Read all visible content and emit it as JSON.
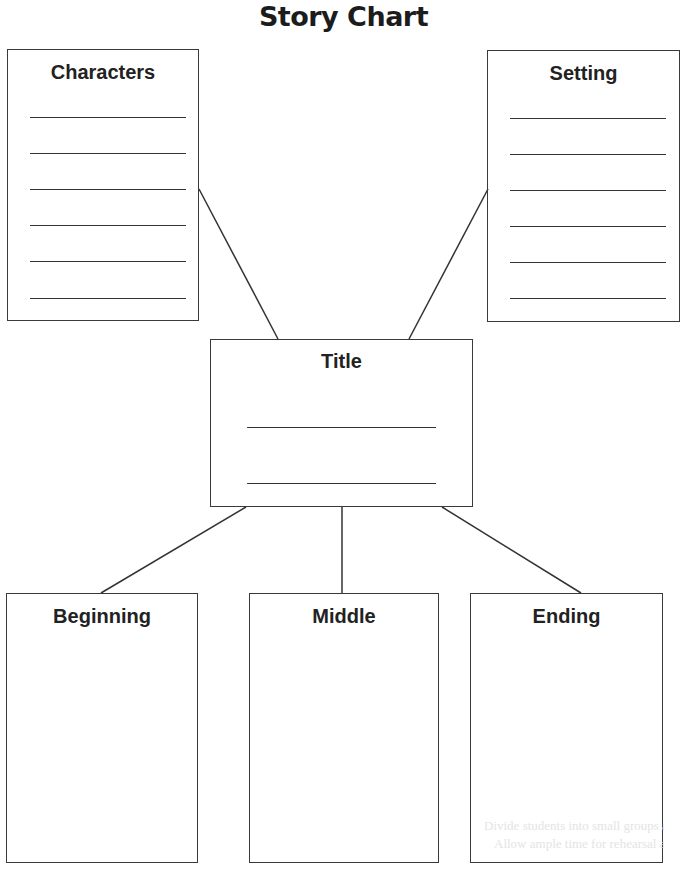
{
  "page": {
    "title": "Story Chart"
  },
  "boxes": {
    "characters": {
      "label": "Characters",
      "lines": 6
    },
    "setting": {
      "label": "Setting",
      "lines": 6
    },
    "title": {
      "label": "Title",
      "lines": 2
    },
    "beginning": {
      "label": "Beginning"
    },
    "middle": {
      "label": "Middle"
    },
    "ending": {
      "label": "Ending"
    }
  },
  "bleed_through_text": [
    "Divide students into small groups and have",
    "Allow ample time for rehearsal and the"
  ],
  "colors": {
    "ink": "#333333",
    "background": "#ffffff"
  }
}
